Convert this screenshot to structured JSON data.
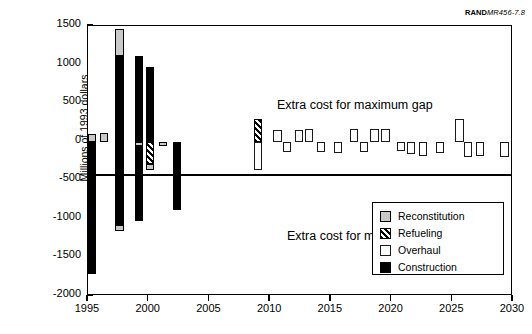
{
  "credit": {
    "brand": "RAND",
    "document": "MR456-7.8"
  },
  "annotations": {
    "maximum_gap": "Extra cost for maximum gap",
    "minimum_gap": "Extra cost for minimum gap"
  },
  "axes": {
    "ylabel": "Millions of 1993 dollars",
    "yticks": [
      1500,
      1000,
      500,
      0,
      -500,
      -1000,
      -1500,
      -2000
    ],
    "yticklabels": [
      "1500",
      "1000",
      "500",
      "0",
      "-500",
      "-1000",
      "-1500",
      "-2000"
    ],
    "xticks": [
      1995,
      2000,
      2005,
      2010,
      2015,
      2020,
      2025,
      2030
    ],
    "xticklabels": [
      "1995",
      "2000",
      "2005",
      "2010",
      "2015",
      "2020",
      "2025",
      "2030"
    ]
  },
  "legend": {
    "position": "bottom-right",
    "items": [
      {
        "label": "Reconstitution",
        "key": "reconstitution",
        "color": "#c9c9c9"
      },
      {
        "label": "Refueling",
        "key": "refueling",
        "color": "hatched"
      },
      {
        "label": "Overhaul",
        "key": "overhaul",
        "color": "#ffffff"
      },
      {
        "label": "Construction",
        "key": "construction",
        "color": "#000000"
      }
    ]
  },
  "chart_data": {
    "type": "bar",
    "title": "",
    "xlabel": "",
    "ylabel": "Millions of 1993 dollars",
    "xlim": [
      1995,
      2030
    ],
    "ylim": [
      -2000,
      1500
    ],
    "grid": false,
    "legend_position": "bottom-right",
    "note": "Stacked/overlaid bars per year; positive = extra cost for maximum gap, negative = extra cost for minimum gap",
    "series": [
      {
        "name": "Reconstitution",
        "style": "gray"
      },
      {
        "name": "Refueling",
        "style": "hatched"
      },
      {
        "name": "Overhaul",
        "style": "white"
      },
      {
        "name": "Construction",
        "style": "black"
      }
    ],
    "bars": [
      {
        "year": 1995.3,
        "series": "Reconstitution",
        "y0": 0,
        "y1": 105
      },
      {
        "year": 1995.3,
        "series": "Construction",
        "y0": 0,
        "y1": -1720
      },
      {
        "year": 1996.3,
        "series": "Reconstitution",
        "y0": 0,
        "y1": 115
      },
      {
        "year": 1997.6,
        "series": "Construction",
        "y0": 0,
        "y1": 1105
      },
      {
        "year": 1997.6,
        "series": "Reconstitution",
        "y0": 1105,
        "y1": 1455
      },
      {
        "year": 1997.6,
        "series": "Construction",
        "y0": 0,
        "y1": -1085
      },
      {
        "year": 1997.6,
        "series": "Reconstitution",
        "y0": -1085,
        "y1": -1155
      },
      {
        "year": 1999.2,
        "series": "Construction",
        "y0": 0,
        "y1": 1110
      },
      {
        "year": 1999.2,
        "series": "Reconstitution",
        "y0": 0,
        "y1": -60
      },
      {
        "year": 1999.2,
        "series": "Construction",
        "y0": -60,
        "y1": -1030
      },
      {
        "year": 2000.1,
        "series": "Construction",
        "y0": 0,
        "y1": 975
      },
      {
        "year": 2000.1,
        "series": "Refueling",
        "y0": 0,
        "y1": -295
      },
      {
        "year": 2000.1,
        "series": "Reconstitution",
        "y0": -295,
        "y1": -365
      },
      {
        "year": 2001.2,
        "series": "Reconstitution",
        "y0": 0,
        "y1": -60
      },
      {
        "year": 2002.3,
        "series": "Construction",
        "y0": 0,
        "y1": -890
      },
      {
        "year": 2009.0,
        "series": "Refueling",
        "y0": 0,
        "y1": 295
      },
      {
        "year": 2009.0,
        "series": "Overhaul",
        "y0": 0,
        "y1": -370
      },
      {
        "year": 2010.6,
        "series": "Overhaul",
        "y0": 0,
        "y1": 150
      },
      {
        "year": 2011.4,
        "series": "Overhaul",
        "y0": 0,
        "y1": -135
      },
      {
        "year": 2012.4,
        "series": "Overhaul",
        "y0": 0,
        "y1": 150
      },
      {
        "year": 2013.2,
        "series": "Overhaul",
        "y0": 0,
        "y1": 165
      },
      {
        "year": 2014.2,
        "series": "Overhaul",
        "y0": 0,
        "y1": -130
      },
      {
        "year": 2015.6,
        "series": "Overhaul",
        "y0": 0,
        "y1": -140
      },
      {
        "year": 2016.9,
        "series": "Overhaul",
        "y0": 0,
        "y1": 160
      },
      {
        "year": 2017.7,
        "series": "Overhaul",
        "y0": 0,
        "y1": -135
      },
      {
        "year": 2018.6,
        "series": "Overhaul",
        "y0": 0,
        "y1": 160
      },
      {
        "year": 2019.5,
        "series": "Overhaul",
        "y0": 0,
        "y1": 170
      },
      {
        "year": 2020.8,
        "series": "Overhaul",
        "y0": 0,
        "y1": -125
      },
      {
        "year": 2021.6,
        "series": "Overhaul",
        "y0": 0,
        "y1": -165
      },
      {
        "year": 2022.6,
        "series": "Overhaul",
        "y0": 0,
        "y1": -180
      },
      {
        "year": 2024.0,
        "series": "Overhaul",
        "y0": 0,
        "y1": -140
      },
      {
        "year": 2025.6,
        "series": "Overhaul",
        "y0": 0,
        "y1": 290
      },
      {
        "year": 2026.3,
        "series": "Overhaul",
        "y0": 0,
        "y1": -195
      },
      {
        "year": 2027.3,
        "series": "Overhaul",
        "y0": 0,
        "y1": -190
      },
      {
        "year": 2029.3,
        "series": "Overhaul",
        "y0": 0,
        "y1": -200
      }
    ]
  }
}
